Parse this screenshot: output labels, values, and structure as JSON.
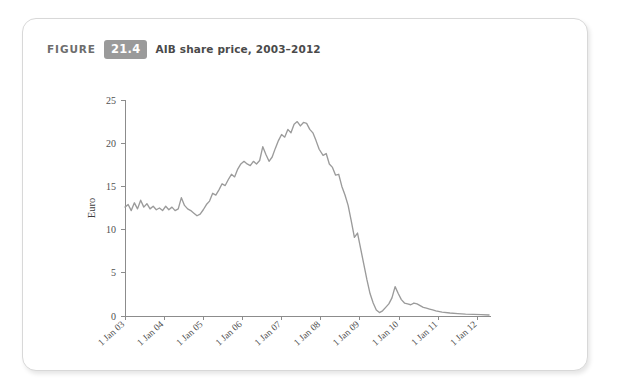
{
  "figure": {
    "label": "FIGURE",
    "number": "21.4",
    "title": "AIB share price, 2003–2012",
    "badge_color": "#9a9a9a",
    "badge_text_color": "#ffffff"
  },
  "chart_data": {
    "type": "line",
    "title": "AIB share price, 2003–2012",
    "xlabel": "Year",
    "ylabel": "Euro",
    "grid": false,
    "legend": null,
    "line_color": "#9b9b9b",
    "axis_color": "#8c8c8c",
    "xlim": [
      2003.0,
      2012.35
    ],
    "ylim": [
      0,
      25
    ],
    "yticks": [
      0,
      5,
      10,
      15,
      20,
      25
    ],
    "ytick_labels": [
      "0",
      "5",
      "10",
      "15",
      "20",
      "25"
    ],
    "xticks": [
      2003,
      2004,
      2005,
      2006,
      2007,
      2008,
      2009,
      2010,
      2011,
      2012
    ],
    "xtick_labels": [
      "1 Jan 03",
      "1 Jan 04",
      "1 Jan 05",
      "1 Jan 06",
      "1 Jan 07",
      "1 Jan 08",
      "1 Jan 09",
      "1 Jan 10",
      "1 Jan 11",
      "1 Jan 12"
    ],
    "series": [
      {
        "name": "AIB share price",
        "units": "Euro",
        "x": [
          2003.0,
          2003.08,
          2003.16,
          2003.24,
          2003.32,
          2003.4,
          2003.48,
          2003.56,
          2003.64,
          2003.72,
          2003.8,
          2003.88,
          2003.96,
          2004.04,
          2004.12,
          2004.2,
          2004.28,
          2004.36,
          2004.44,
          2004.52,
          2004.6,
          2004.68,
          2004.76,
          2004.84,
          2004.92,
          2005.0,
          2005.08,
          2005.16,
          2005.24,
          2005.32,
          2005.4,
          2005.48,
          2005.56,
          2005.64,
          2005.72,
          2005.8,
          2005.88,
          2005.96,
          2006.04,
          2006.12,
          2006.2,
          2006.28,
          2006.36,
          2006.44,
          2006.52,
          2006.6,
          2006.68,
          2006.76,
          2006.84,
          2006.92,
          2007.0,
          2007.08,
          2007.16,
          2007.24,
          2007.32,
          2007.4,
          2007.48,
          2007.56,
          2007.64,
          2007.72,
          2007.8,
          2007.88,
          2007.96,
          2008.06,
          2008.14,
          2008.22,
          2008.3,
          2008.38,
          2008.46,
          2008.54,
          2008.62,
          2008.7,
          2008.78,
          2008.86,
          2008.94,
          2009.02,
          2009.1,
          2009.18,
          2009.26,
          2009.34,
          2009.42,
          2009.5,
          2009.58,
          2009.66,
          2009.74,
          2009.82,
          2009.9,
          2009.98,
          2010.06,
          2010.14,
          2010.22,
          2010.3,
          2010.38,
          2010.46,
          2010.54,
          2010.62,
          2010.7,
          2010.78,
          2010.86,
          2010.94,
          2011.1,
          2011.3,
          2011.5,
          2011.7,
          2011.9,
          2012.1,
          2012.3
        ],
        "y": [
          12.6,
          12.9,
          12.2,
          13.1,
          12.4,
          13.4,
          12.6,
          13.0,
          12.4,
          12.7,
          12.3,
          12.5,
          12.2,
          12.7,
          12.3,
          12.6,
          12.2,
          12.4,
          13.7,
          12.8,
          12.4,
          12.2,
          11.9,
          11.6,
          11.8,
          12.3,
          12.9,
          13.3,
          14.2,
          14.0,
          14.6,
          15.3,
          15.1,
          15.8,
          16.4,
          16.1,
          17.0,
          17.6,
          17.9,
          17.6,
          17.4,
          17.9,
          17.6,
          18.0,
          19.6,
          18.7,
          17.9,
          18.4,
          19.4,
          20.3,
          21.0,
          20.7,
          21.6,
          21.2,
          22.2,
          22.5,
          22.0,
          22.4,
          22.3,
          21.6,
          21.2,
          20.3,
          19.3,
          18.6,
          18.8,
          17.6,
          17.2,
          16.3,
          16.4,
          15.0,
          14.0,
          12.8,
          11.0,
          9.1,
          9.6,
          7.8,
          6.0,
          4.2,
          2.6,
          1.5,
          0.7,
          0.4,
          0.6,
          1.0,
          1.4,
          2.1,
          3.4,
          2.6,
          1.9,
          1.5,
          1.4,
          1.3,
          1.5,
          1.4,
          1.2,
          1.0,
          0.9,
          0.8,
          0.7,
          0.6,
          0.45,
          0.35,
          0.28,
          0.22,
          0.18,
          0.15,
          0.12
        ]
      }
    ],
    "annotations": {
      "peak_value": 22.5,
      "peak_date": "1 Jan 07",
      "trough_value": 0.12,
      "trough_date": "1 Jan 12"
    }
  }
}
